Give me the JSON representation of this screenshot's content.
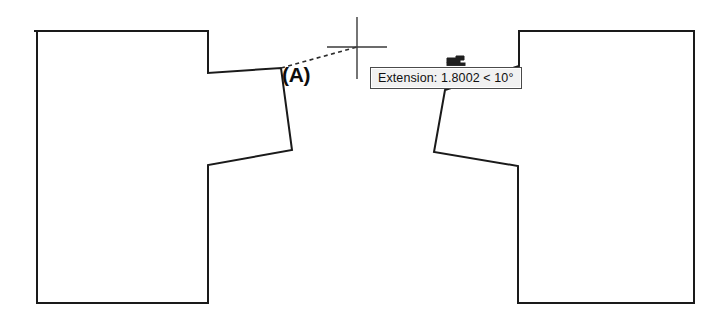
{
  "app": {
    "type": "cad-drafting-canvas",
    "background_color": "#ffffff",
    "line_color": "#1a1a1a",
    "canvas_width": 728,
    "canvas_height": 323
  },
  "tooltip": {
    "name": "extension-tooltip",
    "text": "Extension: 1.8002 < 10°",
    "label": "Extension:",
    "distance": "1.8002",
    "separator": "<",
    "angle": "10°",
    "background_color": "#f1f1f1",
    "border_color": "#4a4a4a",
    "text_color": "#101010"
  },
  "labels": {
    "vertex_a": "(A)"
  },
  "cursor": {
    "name": "crosshair-cursor",
    "x": 357,
    "y": 47,
    "horizontal_span": 60,
    "vertical_span": 62,
    "color": "#3a3a3a"
  },
  "extension_line": {
    "name": "dashed-extension-line",
    "from_x": 281,
    "from_y": 68,
    "to_x": 357,
    "to_y": 47,
    "style": "dashed",
    "color": "#2b2b2b"
  },
  "geometry": {
    "left_part": {
      "name": "left-part-outline",
      "points": "35,31 208,31 208,73 281,68 292,150 208,165 208,303 37,303 37,31"
    },
    "right_part": {
      "name": "right-part-outline",
      "points": "694,31 519,31 519,66 445,90 434,152 518,166 518,303 694,303 694,31"
    },
    "snap_marker": {
      "name": "snap-marker-glyph",
      "x": 447,
      "y": 57,
      "width": 18,
      "height": 9
    }
  }
}
